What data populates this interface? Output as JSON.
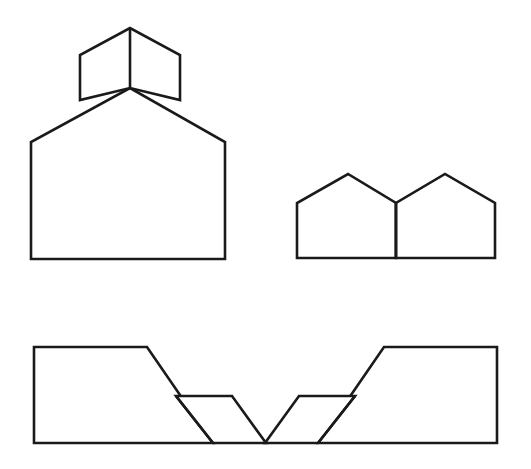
{
  "canvas": {
    "width": 531,
    "height": 469,
    "background_color": "#ffffff",
    "stroke_color": "#1a1a1a",
    "stroke_width": 2.6,
    "fill_color": "#ffffff"
  },
  "figures": [
    {
      "id": "figure-top-left",
      "name": "house-with-chevron-roof",
      "position": "top-left",
      "description": "Large pentagon house with a smaller chevron shape sitting on its roof peak, divided by a vertical line",
      "parts": [
        {
          "id": "top-left-big-pentagon",
          "name": "large-pentagon-body",
          "type": "polygon",
          "points": "31,259 31,142 130,88 225,142 225,259"
        },
        {
          "id": "top-left-chevron",
          "name": "chevron-cap",
          "type": "polygon",
          "points": "80,100 80,55 130,28 180,55 180,100 130,88"
        }
      ],
      "dividers": [
        {
          "id": "top-left-vertical-divider",
          "name": "vertical-divider-line",
          "type": "line",
          "x1": 130,
          "y1": 28,
          "x2": 130,
          "y2": 88
        }
      ]
    },
    {
      "id": "figure-top-right",
      "name": "twin-pentagons",
      "position": "top-right",
      "description": "Two pentagon house shapes sharing a common vertical edge",
      "parts": [
        {
          "id": "top-right-left-pentagon",
          "name": "left-pentagon",
          "type": "polygon",
          "points": "297,258 297,203 348,174 396,203 396,258"
        },
        {
          "id": "top-right-right-pentagon",
          "name": "right-pentagon",
          "type": "polygon",
          "points": "396,258 396,203 445,174 495,203 495,258"
        }
      ],
      "dividers": [
        {
          "id": "top-right-shared-edge",
          "name": "shared-vertical-edge",
          "type": "line",
          "x1": 396,
          "y1": 203,
          "x2": 396,
          "y2": 258
        }
      ]
    },
    {
      "id": "figure-bottom-left",
      "name": "stepped-trapezoid-right-descending",
      "position": "bottom-left",
      "description": "Large right-leaning trapezoid with a smaller parallelogram stepped down to its right",
      "parts": [
        {
          "id": "bottom-left-large-trapezoid",
          "name": "large-trapezoid",
          "type": "polygon",
          "points": "34,347 147,347 213,443 34,443"
        },
        {
          "id": "bottom-left-small-parallelogram",
          "name": "small-parallelogram",
          "type": "polygon",
          "points": "176,396 232,396 266,443 213,443"
        }
      ],
      "dividers": [
        {
          "id": "bottom-left-shared-edge",
          "name": "shared-slanted-edge",
          "type": "line",
          "x1": 176,
          "y1": 396,
          "x2": 213,
          "y2": 443
        }
      ]
    },
    {
      "id": "figure-bottom-right",
      "name": "stepped-trapezoid-left-descending",
      "position": "bottom-right",
      "description": "Mirror image of bottom-left: large left-leaning trapezoid with a smaller parallelogram stepped down to its left",
      "parts": [
        {
          "id": "bottom-right-large-trapezoid",
          "name": "large-trapezoid",
          "type": "polygon",
          "points": "384,347 497,347 497,443 318,443"
        },
        {
          "id": "bottom-right-small-parallelogram",
          "name": "small-parallelogram",
          "type": "polygon",
          "points": "299,396 355,396 318,443 265,443"
        }
      ],
      "dividers": [
        {
          "id": "bottom-right-shared-edge",
          "name": "shared-slanted-edge",
          "type": "line",
          "x1": 355,
          "y1": 396,
          "x2": 318,
          "y2": 443
        }
      ]
    }
  ]
}
